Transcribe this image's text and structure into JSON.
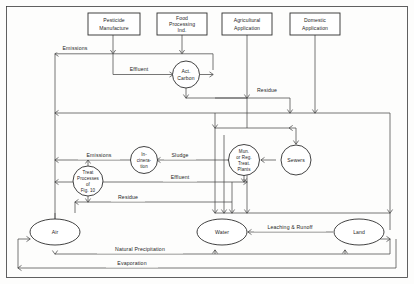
{
  "diagram": {
    "type": "flow-diagram",
    "nodes": {
      "pesticide_manufacture": {
        "label_line1": "Pesticide",
        "label_line2": "Manufacture",
        "shape": "box"
      },
      "food_processing": {
        "label_line1": "Food",
        "label_line2": "Processing",
        "label_line3": "Ind.",
        "shape": "box"
      },
      "agricultural_application": {
        "label_line1": "Agricultural",
        "label_line2": "Application",
        "shape": "box"
      },
      "domestic_application": {
        "label_line1": "Domestic",
        "label_line2": "Application",
        "shape": "box"
      },
      "act_carbon": {
        "label_line1": "Act.",
        "label_line2": "Carbon",
        "shape": "circle"
      },
      "incineration": {
        "label_line1": "In-",
        "label_line2": "cinera-",
        "label_line3": "tion",
        "shape": "circle"
      },
      "treat_processes": {
        "label_line1": "Treat",
        "label_line2": "Processes",
        "label_line3": "of",
        "label_line4": "Fig. 10",
        "shape": "circle"
      },
      "mun_reg_treat_plants": {
        "label_line1": "Mun.",
        "label_line2": "or Reg.",
        "label_line3": "Treat.",
        "label_line4": "Plants",
        "shape": "circle"
      },
      "sewers": {
        "label_line1": "Sewers",
        "shape": "circle"
      },
      "air": {
        "label_line1": "Air",
        "shape": "ellipse"
      },
      "water": {
        "label_line1": "Water",
        "shape": "ellipse"
      },
      "land": {
        "label_line1": "Land",
        "shape": "ellipse"
      }
    },
    "edge_labels": {
      "emissions_top": "Emissions",
      "effluent_top": "Effluent",
      "residue_top": "Residue",
      "emissions_mid": "Emissions",
      "sludge": "Sludge",
      "effluent_mid": "Effluent",
      "residue_mid": "Residue",
      "leaching_runoff": "Leaching & Runoff",
      "natural_precipitation": "Natural Precipitation",
      "evaporation": "Evaporation"
    },
    "colors": {
      "stroke": "#2e2e2e",
      "link": "#4a4a4a",
      "text": "#1d1d1d",
      "background": "#fdfdfc"
    }
  }
}
